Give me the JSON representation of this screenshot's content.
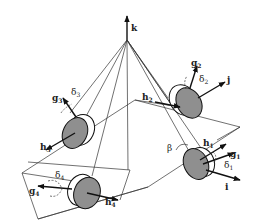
{
  "diagram": {
    "axes": {
      "k": "k",
      "j": "j",
      "i": "i"
    },
    "angle": "β",
    "gyros": [
      {
        "id": 1,
        "h": "h",
        "h_sub": "1",
        "g": "g",
        "g_sub": "1",
        "delta": "δ",
        "delta_sub": "1"
      },
      {
        "id": 2,
        "h": "h",
        "h_sub": "2",
        "g": "g",
        "g_sub": "2",
        "delta": "δ",
        "delta_sub": "2"
      },
      {
        "id": 3,
        "h": "h",
        "h_sub": "3",
        "g": "g",
        "g_sub": "3",
        "delta": "δ",
        "delta_sub": "3"
      },
      {
        "id": 4,
        "h": "h",
        "h_sub": "4",
        "g": "g",
        "g_sub": "4",
        "delta": "δ",
        "delta_sub": "4"
      }
    ],
    "colors": {
      "disc_face": "#8f8f8f",
      "line": "#333333",
      "background": "#ffffff"
    }
  }
}
